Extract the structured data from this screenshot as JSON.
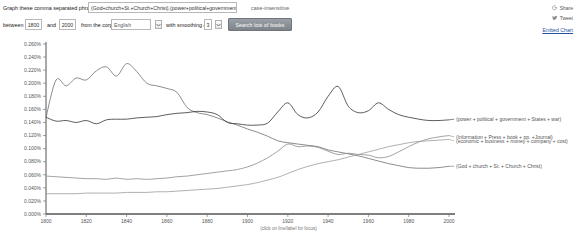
{
  "query_bar": {
    "prompt_label": "Graph these comma separated phrases:",
    "phrase_value": "(God+church+St.+Church+Christ),(power+political+government+Sta",
    "case_insensitive_label": "case-insensitive",
    "between_label": "between",
    "start_year": "1800",
    "and_label": "and",
    "end_year": "2000",
    "corpus_label": "from the corpus",
    "corpus_value": "English",
    "smoothing_label": "with smoothing of",
    "smoothing_value": "3",
    "search_button_label": "Search lots of books"
  },
  "actions": {
    "share_label": "Share",
    "tweet_label": "Tweet",
    "embed_label": "Embed Chart"
  },
  "chart_data": {
    "type": "line",
    "title": "",
    "xlabel": "",
    "ylabel": "",
    "xlim": [
      1800,
      2000
    ],
    "ylim": [
      0.0,
      0.0026
    ],
    "grid": false,
    "legend_position": "right-inline",
    "x_ticks": [
      "1800",
      "1820",
      "1840",
      "1860",
      "1880",
      "1900",
      "1920",
      "1940",
      "1960",
      "1980",
      "2000"
    ],
    "y_ticks": [
      "0.000%",
      "0.020%",
      "0.040%",
      "0.060%",
      "0.080%",
      "0.100%",
      "0.120%",
      "0.140%",
      "0.160%",
      "0.180%",
      "0.200%",
      "0.220%",
      "0.240%",
      "0.260%"
    ],
    "y_unit": "%",
    "caption": "(click on line/label for focus)",
    "x": [
      1800,
      1805,
      1810,
      1815,
      1820,
      1825,
      1830,
      1835,
      1840,
      1845,
      1850,
      1855,
      1860,
      1865,
      1870,
      1875,
      1880,
      1885,
      1890,
      1895,
      1900,
      1905,
      1910,
      1915,
      1920,
      1925,
      1930,
      1935,
      1940,
      1945,
      1950,
      1955,
      1960,
      1965,
      1970,
      1975,
      1980,
      1985,
      1990,
      1995,
      2000
    ],
    "series": [
      {
        "name": "(God + church + St. + Church + Christ)",
        "color": "#6e6e6e",
        "label_x": 2003,
        "label_y": 0.00073,
        "values": [
          0.00148,
          0.00205,
          0.00196,
          0.00208,
          0.00205,
          0.00219,
          0.00225,
          0.00211,
          0.0023,
          0.00218,
          0.002,
          0.00196,
          0.00192,
          0.00186,
          0.00163,
          0.00155,
          0.00152,
          0.00147,
          0.00141,
          0.00136,
          0.0013,
          0.00125,
          0.00119,
          0.00112,
          0.00109,
          0.00107,
          0.00105,
          0.00103,
          0.00098,
          0.00095,
          0.00092,
          0.00089,
          0.00085,
          0.00081,
          0.00077,
          0.00074,
          0.00071,
          0.0007,
          0.0007,
          0.00071,
          0.00073
        ]
      },
      {
        "name": "(power + political + government + States + war)",
        "color": "#333333",
        "label_x": 2003,
        "label_y": 0.00145,
        "values": [
          0.00148,
          0.00142,
          0.00143,
          0.0014,
          0.00143,
          0.00138,
          0.00144,
          0.00145,
          0.00145,
          0.00147,
          0.00148,
          0.00149,
          0.00152,
          0.00154,
          0.00155,
          0.00157,
          0.00156,
          0.00152,
          0.0014,
          0.00138,
          0.00136,
          0.00136,
          0.00139,
          0.00156,
          0.0017,
          0.00152,
          0.00147,
          0.00156,
          0.0018,
          0.00195,
          0.00165,
          0.00155,
          0.00158,
          0.0017,
          0.0016,
          0.00152,
          0.00148,
          0.00145,
          0.00143,
          0.00143,
          0.00144
        ]
      },
      {
        "name": "(Information + Press + book + pp. +Journal)",
        "color": "#8a8a8a",
        "label_x": 2003,
        "label_y": 0.00118,
        "values": [
          0.00058,
          0.00057,
          0.00056,
          0.00055,
          0.00054,
          0.00054,
          0.00053,
          0.00055,
          0.00053,
          0.00054,
          0.00053,
          0.00054,
          0.00055,
          0.00057,
          0.00058,
          0.0006,
          0.00062,
          0.00064,
          0.00066,
          0.00068,
          0.00072,
          0.00078,
          0.00086,
          0.00096,
          0.00107,
          0.00103,
          0.00104,
          0.00102,
          0.00096,
          0.00091,
          0.00093,
          0.00091,
          0.0009,
          0.00086,
          0.00088,
          0.00095,
          0.00103,
          0.0011,
          0.00115,
          0.00118,
          0.0012
        ]
      },
      {
        "name": "(economic + business + money + company + cost)",
        "color": "#9c9c9c",
        "label_x": 2003,
        "label_y": 0.00112,
        "values": [
          0.00031,
          0.00031,
          0.00031,
          0.00031,
          0.00032,
          0.00032,
          0.00032,
          0.00032,
          0.00033,
          0.00033,
          0.00033,
          0.00034,
          0.00034,
          0.00035,
          0.00036,
          0.00037,
          0.00038,
          0.00039,
          0.00041,
          0.00043,
          0.00045,
          0.00048,
          0.00052,
          0.00056,
          0.00062,
          0.00068,
          0.00073,
          0.00077,
          0.0008,
          0.00083,
          0.00087,
          0.00091,
          0.00095,
          0.00099,
          0.00103,
          0.00106,
          0.00109,
          0.00111,
          0.00112,
          0.00113,
          0.00114
        ]
      }
    ]
  }
}
